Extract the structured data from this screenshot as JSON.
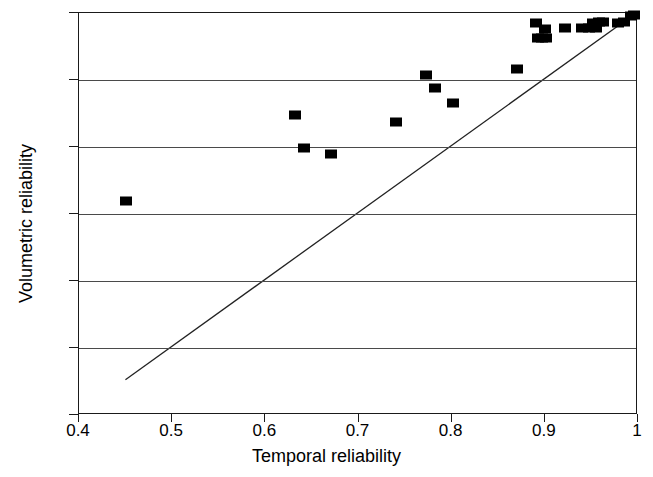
{
  "chart_data": {
    "type": "scatter",
    "title": "",
    "xlabel": "Temporal reliability",
    "ylabel": "Volumetric reliability",
    "xlim": [
      0.4,
      1.0
    ],
    "ylim": [
      0.4,
      1.0
    ],
    "xticks": [
      0.4,
      0.5,
      0.6,
      0.7,
      0.8,
      0.9,
      1.0
    ],
    "xticklabels": [
      "0.4",
      "0.5",
      "0.6",
      "0.7",
      "0.8",
      "0.9",
      "1"
    ],
    "yticks": [
      0.4,
      0.5,
      0.6,
      0.7,
      0.8,
      0.9,
      1.0
    ],
    "yticklabels": [
      "0.4",
      "0.5",
      "0.6",
      "0.7",
      "0.8",
      "0.9",
      "1"
    ],
    "grid": {
      "horizontal": true,
      "vertical": false,
      "levels": [
        0.5,
        0.6,
        0.7,
        0.8,
        0.9
      ]
    },
    "legend": null,
    "marker": {
      "shape": "square",
      "color": "#000000",
      "size": 11
    },
    "series": [
      {
        "name": "samples",
        "points": [
          [
            0.45,
            0.72
          ],
          [
            0.632,
            0.848
          ],
          [
            0.641,
            0.799
          ],
          [
            0.671,
            0.789
          ],
          [
            0.74,
            0.838
          ],
          [
            0.772,
            0.908
          ],
          [
            0.782,
            0.888
          ],
          [
            0.801,
            0.866
          ],
          [
            0.87,
            0.917
          ],
          [
            0.89,
            0.985
          ],
          [
            0.893,
            0.963
          ],
          [
            0.897,
            0.963
          ],
          [
            0.901,
            0.963
          ],
          [
            0.9,
            0.976
          ],
          [
            0.922,
            0.977
          ],
          [
            0.94,
            0.977
          ],
          [
            0.947,
            0.978
          ],
          [
            0.952,
            0.985
          ],
          [
            0.955,
            0.978
          ],
          [
            0.958,
            0.986
          ],
          [
            0.962,
            0.986
          ],
          [
            0.978,
            0.985
          ],
          [
            0.985,
            0.986
          ],
          [
            0.992,
            0.996
          ],
          [
            0.996,
            0.997
          ]
        ]
      }
    ],
    "reference_line": {
      "name": "identity-line",
      "from": [
        0.45,
        0.45
      ],
      "to": [
        1.0,
        1.0
      ],
      "color": "#222222",
      "width": 1.3
    }
  }
}
